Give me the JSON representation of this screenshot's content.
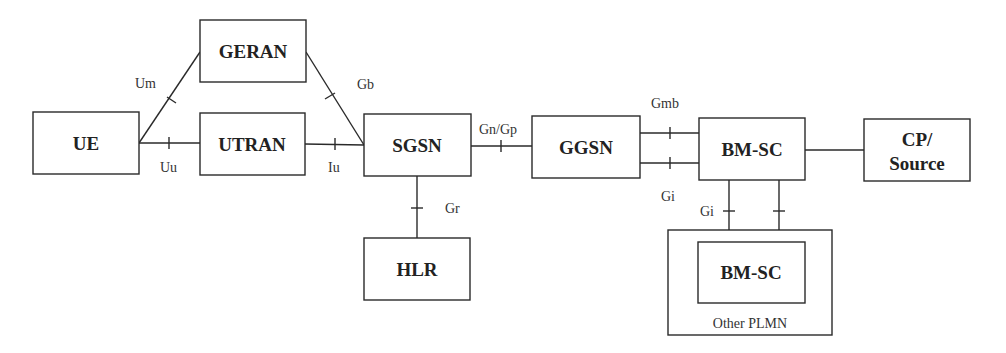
{
  "diagram": {
    "nodes": {
      "ue": {
        "label": "UE"
      },
      "geran": {
        "label": "GERAN"
      },
      "utran": {
        "label": "UTRAN"
      },
      "sgsn": {
        "label": "SGSN"
      },
      "hlr": {
        "label": "HLR"
      },
      "ggsn": {
        "label": "GGSN"
      },
      "bmsc": {
        "label": "BM-SC"
      },
      "cp_source": {
        "line1": "CP/",
        "line2": "Source"
      },
      "bmsc_other": {
        "label": "BM-SC"
      }
    },
    "groups": {
      "other_plmn": {
        "label": "Other PLMN"
      }
    },
    "interfaces": {
      "um": "Um",
      "uu": "Uu",
      "gb": "Gb",
      "iu": "Iu",
      "gr": "Gr",
      "gn_gp": "Gn/Gp",
      "gmb": "Gmb",
      "gi_ggsn": "Gi",
      "gi_other": "Gi"
    },
    "colors": {
      "stroke": "#2a2a2a",
      "text": "#222222",
      "background": "#ffffff"
    }
  }
}
